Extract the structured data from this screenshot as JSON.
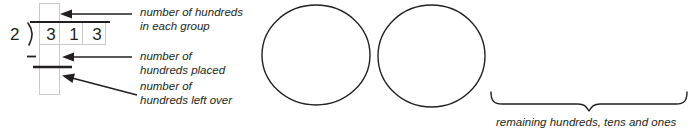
{
  "worksheet": {
    "title": "Long division place-value diagram",
    "division": {
      "divisor": "2",
      "dividend_digits": [
        "3",
        "1",
        "3"
      ],
      "divider_symbol": "division-bracket",
      "minus_symbol": "–",
      "quotient_box_value": "",
      "product_box_value": "",
      "remainder_box_value": ""
    },
    "callouts": [
      {
        "id": "quotient",
        "line1": "number of hundreds",
        "line2": "in each group",
        "arrow": "arrow-left"
      },
      {
        "id": "product",
        "line1": "number of",
        "line2": "hundreds placed",
        "arrow": "arrow-left"
      },
      {
        "id": "remainder",
        "line1": "number of",
        "line2": "hundreds left over",
        "arrow": "arrow-diagonal-up-left"
      }
    ],
    "groups": {
      "count": 2,
      "shape": "circle",
      "labels": [
        "",
        ""
      ]
    },
    "brace": {
      "caption": "remaining hundreds, tens and ones",
      "orientation": "down"
    },
    "colors": {
      "ink": "#231f20",
      "box_outline": "#c8c8c8",
      "circle_outline": "#231f20",
      "background": "#ffffff"
    }
  }
}
